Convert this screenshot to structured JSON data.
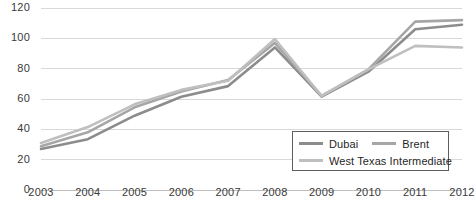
{
  "chart_data": {
    "type": "line",
    "title": "",
    "xlabel": "",
    "ylabel": "",
    "categories": [
      "2003",
      "2004",
      "2005",
      "2006",
      "2007",
      "2008",
      "2009",
      "2010",
      "2011",
      "2012"
    ],
    "x": [
      2003,
      2004,
      2005,
      2006,
      2007,
      2008,
      2009,
      2010,
      2011,
      2012
    ],
    "ylim": [
      0,
      120
    ],
    "yticks": [
      0,
      20,
      40,
      60,
      80,
      100,
      120
    ],
    "ytick_labels": [
      "0",
      "20",
      "40",
      "60",
      "80",
      "100",
      "120"
    ],
    "grid": "horizontal",
    "legend_position": "inside-bottom-right",
    "series": [
      {
        "name": "Dubai",
        "color": "#8c8c8c",
        "values": [
          27.0,
          33.5,
          49.0,
          61.5,
          68.5,
          94.0,
          61.5,
          78.0,
          106.0,
          109.0
        ]
      },
      {
        "name": "Brent",
        "color": "#a6a6a6",
        "values": [
          28.8,
          38.0,
          54.5,
          65.0,
          72.5,
          97.0,
          62.0,
          79.5,
          111.0,
          112.0
        ]
      },
      {
        "name": "West Texas Intermediate",
        "color": "#bfbfbf",
        "values": [
          31.0,
          41.5,
          56.5,
          66.0,
          72.0,
          99.5,
          62.0,
          79.5,
          95.0,
          94.0
        ]
      }
    ]
  },
  "axis": {
    "y_ticks": [
      {
        "label": "120",
        "value": 120
      },
      {
        "label": "100",
        "value": 100
      },
      {
        "label": "80",
        "value": 80
      },
      {
        "label": "60",
        "value": 60
      },
      {
        "label": "40",
        "value": 40
      },
      {
        "label": "20",
        "value": 20
      },
      {
        "label": "0",
        "value": 0
      }
    ],
    "x_ticks": [
      {
        "label": "2003"
      },
      {
        "label": "2004"
      },
      {
        "label": "2005"
      },
      {
        "label": "2006"
      },
      {
        "label": "2007"
      },
      {
        "label": "2008"
      },
      {
        "label": "2009"
      },
      {
        "label": "2010"
      },
      {
        "label": "2011"
      },
      {
        "label": "2012"
      }
    ]
  },
  "legend": {
    "entries": [
      {
        "label": "Dubai",
        "color": "#8c8c8c"
      },
      {
        "label": "Brent",
        "color": "#a6a6a6"
      },
      {
        "label": "West Texas Intermediate",
        "color": "#bfbfbf"
      }
    ]
  },
  "style": {
    "gridline_color": "#d9d9d9",
    "axis_color": "#bfbfbf",
    "text_color": "#3a3a3a",
    "background": "#ffffff"
  }
}
